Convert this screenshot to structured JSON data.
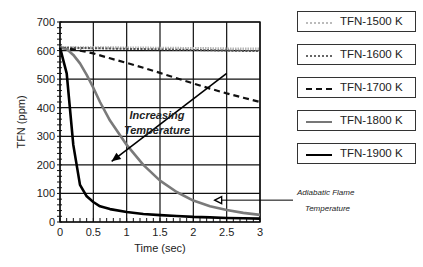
{
  "chart_data": {
    "type": "line",
    "title": "",
    "xlabel": "Time (sec)",
    "ylabel": "TFN (ppm)",
    "xlim": [
      0,
      3
    ],
    "ylim": [
      0,
      700
    ],
    "xticks": [
      0,
      0.5,
      1,
      1.5,
      2,
      2.5,
      3
    ],
    "xtick_labels": [
      "0",
      "0.5",
      "1",
      "1.5",
      "2",
      "2.5",
      "3"
    ],
    "yticks": [
      0,
      100,
      200,
      300,
      400,
      500,
      600,
      700
    ],
    "ytick_labels": [
      "0",
      "100",
      "200",
      "300",
      "400",
      "500",
      "600",
      "700"
    ],
    "grid": true,
    "legend_position": "right",
    "x": [
      0,
      0.1,
      0.2,
      0.3,
      0.4,
      0.5,
      0.6,
      0.75,
      1.0,
      1.25,
      1.5,
      1.75,
      2.0,
      2.25,
      2.5,
      2.75,
      3.0
    ],
    "series": [
      {
        "name": "TFN-1500 K",
        "style": "hatched-light",
        "color": "#aaaaaa",
        "values": [
          610,
          610,
          610,
          610,
          610,
          610,
          610,
          610,
          609,
          609,
          608,
          608,
          607,
          607,
          606,
          606,
          605
        ]
      },
      {
        "name": "TFN-1600 K",
        "style": "hatched",
        "color": "#777777",
        "values": [
          610,
          610,
          610,
          609,
          609,
          608,
          608,
          607,
          606,
          605,
          604,
          603,
          602,
          601,
          600,
          599,
          598
        ]
      },
      {
        "name": "TFN-1700 K",
        "style": "dashed",
        "color": "#111111",
        "values": [
          610,
          608,
          604,
          600,
          595,
          590,
          583,
          573,
          557,
          540,
          522,
          503,
          485,
          467,
          450,
          435,
          420
        ]
      },
      {
        "name": "TFN-1800 K",
        "style": "solid-gray",
        "color": "#777777",
        "values": [
          610,
          605,
          585,
          555,
          515,
          470,
          420,
          355,
          270,
          200,
          145,
          105,
          75,
          55,
          42,
          32,
          25
        ]
      },
      {
        "name": "TFN-1900 K",
        "style": "solid-black",
        "color": "#000000",
        "values": [
          610,
          520,
          270,
          130,
          90,
          70,
          55,
          45,
          35,
          28,
          24,
          21,
          18,
          16,
          14,
          13,
          12
        ]
      }
    ],
    "annotations": [
      {
        "text": "Increasing Temperature",
        "type": "arrow",
        "from": [
          2.5,
          520
        ],
        "to": [
          1.0,
          300
        ]
      },
      {
        "text": "Adiabatic Flame Temperature",
        "type": "arrow-pointer",
        "target": [
          2.35,
          80
        ]
      }
    ]
  },
  "legend": [
    {
      "label": "TFN-1500 K"
    },
    {
      "label": "TFN-1600 K"
    },
    {
      "label": "TFN-1700 K"
    },
    {
      "label": "TFN-1800 K"
    },
    {
      "label": "TFN-1900 K"
    }
  ],
  "annotations": {
    "increasing_line1": "Increasing",
    "increasing_line2": "Temperature",
    "adiabatic_line1": "Adiabatic Flame",
    "adiabatic_line2": "Temperature"
  },
  "axes": {
    "xlabel": "Time (sec)",
    "ylabel": "TFN (ppm)"
  }
}
